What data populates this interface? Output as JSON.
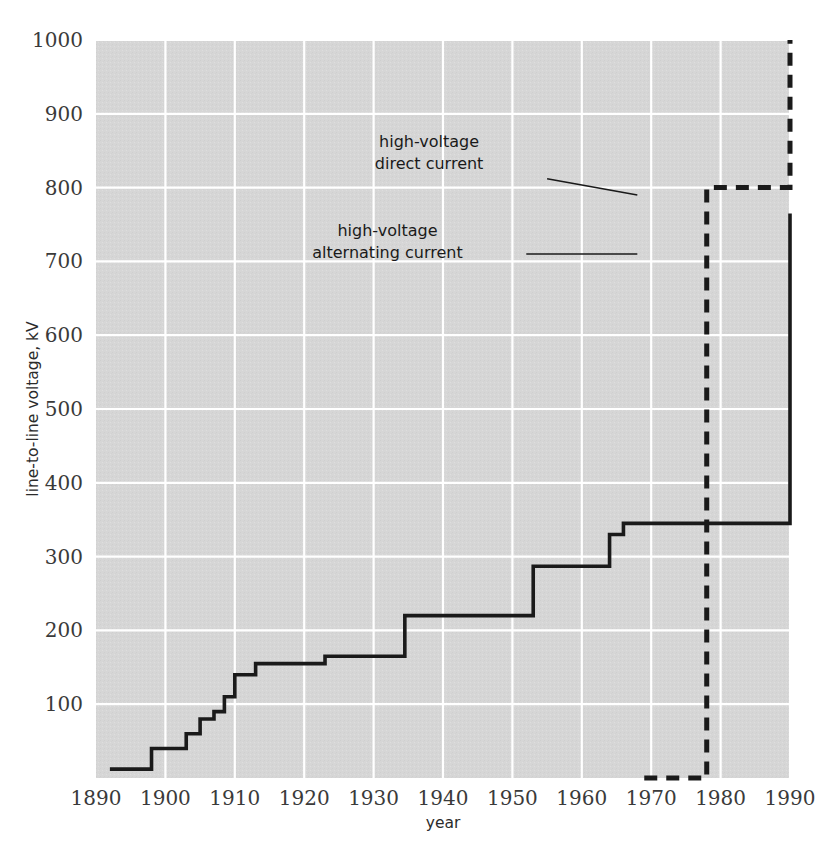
{
  "chart_data": {
    "type": "line",
    "title": "",
    "xlabel": "year",
    "ylabel": "line-to-line voltage, kV",
    "xlim": [
      1890,
      1990
    ],
    "ylim": [
      0,
      1000
    ],
    "xticks": [
      "1890",
      "1900",
      "1910",
      "1920",
      "1930",
      "1940",
      "1950",
      "1960",
      "1970",
      "1980",
      "1990"
    ],
    "yticks": [
      "100",
      "200",
      "300",
      "400",
      "500",
      "600",
      "700",
      "800",
      "900",
      "1000"
    ],
    "grid": true,
    "legend_position": "inline-annotations",
    "plot_background": "#d6d6d6",
    "gridline_color": "#ffffff",
    "line_color": "#1a1a1a",
    "series": [
      {
        "name": "high-voltage alternating current",
        "style": "solid",
        "step": "post",
        "x": [
          1892,
          1896,
          1898,
          1903,
          1905,
          1907,
          1908.5,
          1910,
          1913,
          1923,
          1934.5,
          1953,
          1958,
          1964,
          1966,
          1969,
          1990
        ],
        "values": [
          12,
          12,
          40,
          60,
          80,
          90,
          110,
          140,
          155,
          165,
          220,
          287,
          287,
          330,
          345,
          345,
          765
        ]
      },
      {
        "name": "high-voltage direct current",
        "style": "dashed",
        "step": "post",
        "x": [
          1969,
          1978,
          1990
        ],
        "values": [
          0,
          800,
          1000
        ]
      }
    ],
    "annotations": [
      {
        "name": "hvdc-label",
        "lines": [
          "high-voltage",
          "direct current"
        ],
        "text_anchor_x": 1938,
        "text_anchor_y": 855,
        "leader_from": [
          1955,
          812
        ],
        "leader_to": [
          1968,
          790
        ]
      },
      {
        "name": "hvac-label",
        "lines": [
          "high-voltage",
          "alternating current"
        ],
        "text_anchor_x": 1932,
        "text_anchor_y": 735,
        "leader_from": [
          1952,
          710
        ],
        "leader_to": [
          1968,
          710
        ]
      }
    ]
  }
}
